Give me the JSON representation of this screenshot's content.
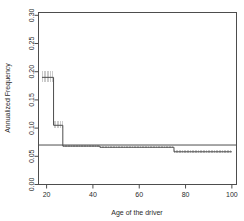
{
  "chart_data": {
    "type": "line",
    "subtype": "step-function-with-confidence-band",
    "title": "",
    "xlabel": "Age of the driver",
    "ylabel": "Annualized Frequency",
    "xlim": [
      16.5,
      102
    ],
    "ylim": [
      0.0,
      0.305
    ],
    "xticks": [
      20,
      40,
      60,
      80,
      100
    ],
    "xtick_labels": [
      "20",
      "40",
      "60",
      "80",
      "100"
    ],
    "yticks": [
      0.0,
      0.05,
      0.1,
      0.15,
      0.2,
      0.25,
      0.3
    ],
    "ytick_labels": [
      "0.00",
      "0.05",
      "0.10",
      "0.15",
      "0.20",
      "0.25",
      "0.30"
    ],
    "grid": false,
    "legend": false,
    "series": [
      {
        "name": "Annualized frequency (step estimate)",
        "style": "step",
        "color": "#4d4d4d",
        "steps": [
          {
            "x_start": 18.0,
            "x_end": 23.0,
            "y": 0.19,
            "ci_low": 0.182,
            "ci_high": 0.202
          },
          {
            "x_start": 23.0,
            "x_end": 27.0,
            "y": 0.105,
            "ci_low": 0.1,
            "ci_high": 0.112
          },
          {
            "x_start": 27.0,
            "x_end": 43.0,
            "y": 0.068,
            "ci_low": 0.066,
            "ci_high": 0.07
          },
          {
            "x_start": 43.0,
            "x_end": 75.0,
            "y": 0.066,
            "ci_low": 0.064,
            "ci_high": 0.068
          },
          {
            "x_start": 75.0,
            "x_end": 100.0,
            "y": 0.058,
            "ci_low": 0.055,
            "ci_high": 0.061
          }
        ]
      },
      {
        "name": "Overall reference level",
        "style": "horizontal-line",
        "color": "#4d4d4d",
        "y": 0.07
      }
    ],
    "confidence_band": {
      "render": "vertical-hatch",
      "color": "#b5b5b5"
    }
  },
  "axes": {
    "x_title": "Age of the driver",
    "y_title": "Annualized Frequency"
  }
}
